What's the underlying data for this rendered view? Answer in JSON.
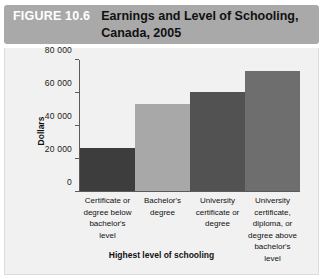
{
  "figure": {
    "number_label": "FIGURE 10.6",
    "title": "Earnings and Level of Schooling, Canada, 2005"
  },
  "colors": {
    "banner": "#a9a9a9",
    "panel_background": "#f1f1f1",
    "axis": "#5a5a5a",
    "bar_1": "#3d3d3d",
    "bar_2": "#a8a8a8",
    "bar_3": "#525252",
    "bar_4": "#6e6e6e"
  },
  "chart_data": {
    "type": "bar",
    "title": "Earnings and Level of Schooling, Canada, 2005",
    "xlabel": "Highest level of schooling",
    "ylabel": "Dollars",
    "ylim": [
      0,
      80000
    ],
    "yticks": [
      0,
      20000,
      40000,
      60000,
      80000
    ],
    "ytick_labels": [
      "0",
      "20 000",
      "40 000",
      "60 000",
      "80 000"
    ],
    "grid": false,
    "legend": false,
    "categories": [
      "Certificate or degree below bachelor's level",
      "Bachelor's degree",
      "University certificate or degree",
      "University certificate, diploma, or degree above bachelor's level"
    ],
    "values": [
      26000,
      52500,
      60000,
      73000
    ],
    "bar_colors": [
      "#3d3d3d",
      "#a8a8a8",
      "#525252",
      "#6e6e6e"
    ]
  }
}
